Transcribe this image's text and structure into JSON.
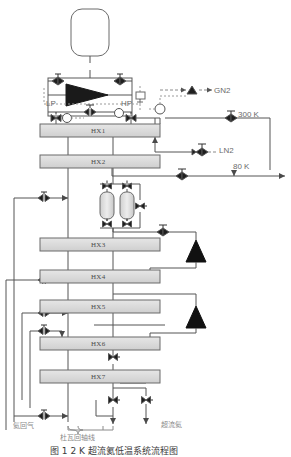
{
  "figure": {
    "type": "process-flow-diagram",
    "domain": "cryogenic helium liquefier / refrigerator",
    "caption": "图 1  2 K 超流氦低温系统流程图",
    "background": "#ffffff",
    "line_color": "#555555",
    "fill_color": "#d9d9d9",
    "dashed_color": "#8a8a8a"
  },
  "compressor": {
    "low_pressure_label": "LP",
    "high_pressure_label": "HP",
    "oil_tank_name": "oil-separator-tank"
  },
  "heat_exchangers": [
    {
      "id": "HX1",
      "label": "HX1",
      "x": 40,
      "y": 124,
      "w": 120,
      "h": 13
    },
    {
      "id": "HX2",
      "label": "HX2",
      "x": 40,
      "y": 155,
      "w": 120,
      "h": 13
    },
    {
      "id": "HX3",
      "label": "HX3",
      "x": 40,
      "y": 238,
      "w": 120,
      "h": 13
    },
    {
      "id": "HX4",
      "label": "HX4",
      "x": 40,
      "y": 270,
      "w": 120,
      "h": 13
    },
    {
      "id": "HX5",
      "label": "HX5",
      "x": 40,
      "y": 300,
      "w": 120,
      "h": 13
    },
    {
      "id": "HX6",
      "label": "HX6",
      "x": 40,
      "y": 337,
      "w": 120,
      "h": 13
    },
    {
      "id": "HX7",
      "label": "HX7",
      "x": 40,
      "y": 370,
      "w": 120,
      "h": 13
    }
  ],
  "stream_labels": [
    {
      "id": "gn2",
      "text": "GN2",
      "x": 214,
      "y": 93
    },
    {
      "id": "t300k",
      "text": "300 K",
      "x": 240,
      "y": 117
    },
    {
      "id": "ln2",
      "text": "LN2",
      "x": 219,
      "y": 150
    },
    {
      "id": "t80k",
      "text": "80 K",
      "x": 233,
      "y": 159
    }
  ],
  "chinese_labels": [
    {
      "id": "helium-return-gas",
      "text": "氦回气",
      "x": 13,
      "y": 424
    },
    {
      "id": "dewar-return-line",
      "text": "杜瓦回轴线",
      "x": 62,
      "y": 433
    },
    {
      "id": "superfluid-helium",
      "text": "超流氦",
      "x": 163,
      "y": 423
    }
  ],
  "adsorbers": [
    {
      "id": "adsorber-a",
      "x": 103,
      "y": 192
    },
    {
      "id": "adsorber-b",
      "x": 123,
      "y": 192
    }
  ],
  "turbines": [
    {
      "id": "turbine-1",
      "x": 188,
      "y": 238
    },
    {
      "id": "turbine-2",
      "x": 188,
      "y": 305
    }
  ],
  "instruments": [
    {
      "id": "pressure-gauge-1",
      "symbol": "P",
      "x": 67,
      "y": 118
    },
    {
      "id": "temp-gauge-1",
      "symbol": "T",
      "x": 119,
      "y": 113
    },
    {
      "id": "flow-gauge-1",
      "symbol": "F",
      "x": 160,
      "y": 109
    }
  ]
}
